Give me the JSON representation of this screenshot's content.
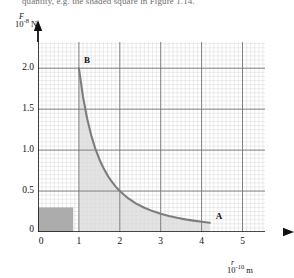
{
  "caption": {
    "text": "quantity, e.g. the shaded square in Figure 1.14."
  },
  "axes": {
    "y_label_symbol": "F",
    "y_label_scale": "10",
    "y_label_exponent": "-8",
    "y_label_unit": "N",
    "x_label_symbol": "r",
    "x_label_scale": "10",
    "x_label_exponent": "-10",
    "x_label_unit": "m"
  },
  "points": [
    {
      "name": "B",
      "label": "B",
      "r": 1.0,
      "F": 2.0
    },
    {
      "name": "A",
      "label": "A",
      "r": 4.2,
      "F": 0.115
    }
  ],
  "colors": {
    "curve": "#7d7d7d",
    "major_grid": "#6f6f6f",
    "minor_grid": "#cfcfcf",
    "axis": "#111111",
    "shade_under_curve": "#d9d9d9",
    "shade_box": "#a8a8a8",
    "background": "#ffffff"
  },
  "chart_data": {
    "type": "line",
    "title": "",
    "subtitle": "",
    "xlabel": "r/10^-10 m",
    "ylabel": "F/10^-8 N",
    "xlim": [
      0,
      5.55
    ],
    "ylim": [
      0,
      2.32
    ],
    "xticks": [
      1,
      2,
      3,
      4,
      5
    ],
    "xtick_labels": [
      "1",
      "2",
      "3",
      "4",
      "5"
    ],
    "yticks": [
      0,
      0.5,
      1.0,
      1.5,
      2.0
    ],
    "ytick_labels": [
      "0",
      "0.5",
      "1.0",
      "1.5",
      "2.0"
    ],
    "origin_label": "0",
    "grid": true,
    "grid_major_step_x": 1,
    "grid_major_step_y": 0.5,
    "grid_minor_step_x": 0.1,
    "grid_minor_step_y": 0.05,
    "legend": null,
    "relation": "F = 2.0 / r^2",
    "series": [
      {
        "name": "force-curve",
        "type": "line",
        "x": [
          1.0,
          1.1,
          1.2,
          1.3,
          1.4,
          1.5,
          1.6,
          1.7,
          1.8,
          1.9,
          2.0,
          2.2,
          2.4,
          2.6,
          2.8,
          3.0,
          3.2,
          3.4,
          3.6,
          3.8,
          4.0,
          4.2
        ],
        "values": [
          2.0,
          1.653,
          1.389,
          1.183,
          1.02,
          0.889,
          0.781,
          0.692,
          0.617,
          0.554,
          0.5,
          0.413,
          0.347,
          0.296,
          0.255,
          0.222,
          0.195,
          0.173,
          0.154,
          0.139,
          0.125,
          0.113
        ]
      }
    ],
    "shaded_regions": [
      {
        "name": "area-under-curve",
        "description": "area under F-r curve between A and B",
        "x_from": 1.0,
        "x_to": 4.2,
        "color": "#d9d9d9"
      },
      {
        "name": "unit-square-box",
        "description": "shaded square representing one unit of work",
        "x_from": 0.0,
        "x_to": 0.86,
        "y_from": 0.0,
        "y_to": 0.3,
        "color": "#a8a8a8"
      }
    ],
    "annotations": [
      {
        "text": "B",
        "x": 1.0,
        "y": 2.0
      },
      {
        "text": "A",
        "x": 4.2,
        "y": 0.115
      }
    ]
  }
}
